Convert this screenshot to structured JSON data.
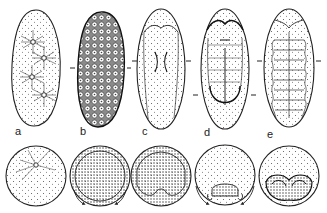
{
  "figure": {
    "stages": [
      {
        "label": "a",
        "description": "cleavage nuclei in yolk"
      },
      {
        "label": "b",
        "description": "blastoderm"
      },
      {
        "label": "c",
        "description": "germ band formation"
      },
      {
        "label": "d",
        "description": "germ band with segmentation, amnion folds"
      },
      {
        "label": "e",
        "description": "segmented germ band"
      }
    ],
    "colors": {
      "ink": "#222222",
      "background": "#ffffff"
    }
  }
}
